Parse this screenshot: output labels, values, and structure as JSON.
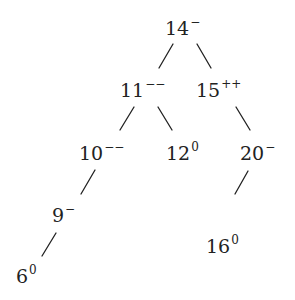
{
  "diagram": {
    "type": "binary-tree",
    "nodes": [
      {
        "id": "n14",
        "value": "14",
        "mark": "−"
      },
      {
        "id": "n11",
        "value": "11",
        "mark": "−−"
      },
      {
        "id": "n15",
        "value": "15",
        "mark": "++"
      },
      {
        "id": "n10",
        "value": "10",
        "mark": "−−"
      },
      {
        "id": "n12",
        "value": "12",
        "mark": "0"
      },
      {
        "id": "n20",
        "value": "20",
        "mark": "−"
      },
      {
        "id": "n9",
        "value": "9",
        "mark": "−"
      },
      {
        "id": "n16",
        "value": "16",
        "mark": "0"
      },
      {
        "id": "n6",
        "value": "6",
        "mark": "0"
      }
    ],
    "edges": [
      {
        "from": "n14",
        "to": "n11"
      },
      {
        "from": "n14",
        "to": "n15"
      },
      {
        "from": "n11",
        "to": "n10"
      },
      {
        "from": "n11",
        "to": "n12"
      },
      {
        "from": "n15",
        "to": "n20"
      },
      {
        "from": "n10",
        "to": "n9"
      },
      {
        "from": "n20",
        "to": "n16"
      },
      {
        "from": "n9",
        "to": "n6"
      }
    ]
  }
}
